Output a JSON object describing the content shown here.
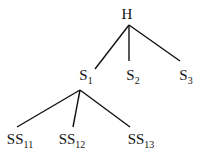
{
  "diagram": {
    "type": "tree",
    "nodes": [
      {
        "id": "H",
        "base": "H",
        "sub": "",
        "x": 127,
        "y": 7
      },
      {
        "id": "S1",
        "base": "S",
        "sub": "1",
        "x": 86,
        "y": 68
      },
      {
        "id": "S2",
        "base": "S",
        "sub": "2",
        "x": 133,
        "y": 68
      },
      {
        "id": "S3",
        "base": "S",
        "sub": "3",
        "x": 186,
        "y": 68
      },
      {
        "id": "SS11",
        "base": "SS",
        "sub": "11",
        "x": 20,
        "y": 132
      },
      {
        "id": "SS12",
        "base": "SS",
        "sub": "12",
        "x": 72,
        "y": 132
      },
      {
        "id": "SS13",
        "base": "SS",
        "sub": "13",
        "x": 141,
        "y": 132
      }
    ],
    "edges": [
      {
        "from": "H",
        "to": "S1",
        "x1": 129,
        "y1": 25,
        "x2": 95,
        "y2": 69
      },
      {
        "from": "H",
        "to": "S2",
        "x1": 129,
        "y1": 25,
        "x2": 129,
        "y2": 61
      },
      {
        "from": "H",
        "to": "S3",
        "x1": 129,
        "y1": 25,
        "x2": 180,
        "y2": 61
      },
      {
        "from": "S1",
        "to": "SS11",
        "x1": 80,
        "y1": 90,
        "x2": 17,
        "y2": 127
      },
      {
        "from": "S1",
        "to": "SS12",
        "x1": 80,
        "y1": 90,
        "x2": 73,
        "y2": 127
      },
      {
        "from": "S1",
        "to": "SS13",
        "x1": 80,
        "y1": 90,
        "x2": 130,
        "y2": 127
      }
    ]
  }
}
